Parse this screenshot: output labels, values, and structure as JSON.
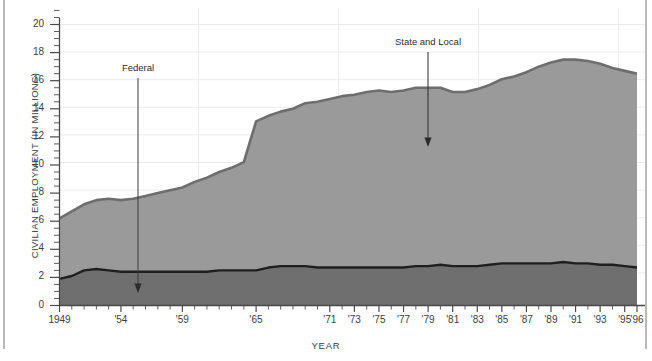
{
  "figure": {
    "title_fragment": "",
    "background": "#ffffff"
  },
  "axes": {
    "ylabel": "CIVILIAN EMPLOYMENT (IN MILLIONS)",
    "xlabel": "YEAR",
    "ytick_labels": [
      "20",
      "18",
      "16",
      "14",
      "12",
      "10",
      "8",
      "6",
      "4",
      "2",
      "0"
    ],
    "xtick_labels": [
      "1949",
      "'54",
      "'59",
      "'65",
      "'71",
      "'73",
      "'75",
      "'77",
      "'79",
      "'81",
      "'83",
      "'85",
      "'87",
      "'89",
      "'91",
      "'93",
      "'95",
      "'96"
    ]
  },
  "annotations": {
    "federal": "Federal",
    "state_local": "State and Local"
  },
  "colors": {
    "state_local_fill": "#9a9a9a",
    "state_local_edge": "#6e6e6e",
    "federal_fill": "#6f6f6f",
    "federal_edge": "#1f1f1f",
    "gridline": "#e8e8e8",
    "axis": "#4a4a4a",
    "text": "#3d3d3d"
  },
  "chart_data": {
    "type": "area",
    "stacked": true,
    "title": "",
    "xlabel": "YEAR",
    "ylabel": "CIVILIAN EMPLOYMENT (IN MILLIONS)",
    "xlim": [
      1949,
      1996
    ],
    "ylim": [
      0,
      20
    ],
    "ytick_values": [
      0,
      2,
      4,
      6,
      8,
      10,
      12,
      14,
      16,
      18,
      20
    ],
    "xtick_values": [
      1949,
      1954,
      1959,
      1965,
      1971,
      1973,
      1975,
      1977,
      1979,
      1981,
      1983,
      1985,
      1987,
      1989,
      1991,
      1993,
      1995,
      1996
    ],
    "grid": "both-faint",
    "legend": "annotated-arrows",
    "x": [
      1949,
      1950,
      1951,
      1952,
      1953,
      1954,
      1955,
      1956,
      1957,
      1958,
      1959,
      1960,
      1961,
      1962,
      1963,
      1964,
      1965,
      1966,
      1967,
      1968,
      1969,
      1970,
      1971,
      1972,
      1973,
      1974,
      1975,
      1976,
      1977,
      1978,
      1979,
      1980,
      1981,
      1982,
      1983,
      1984,
      1985,
      1986,
      1987,
      1988,
      1989,
      1990,
      1991,
      1992,
      1993,
      1994,
      1995,
      1996
    ],
    "series": [
      {
        "name": "Federal",
        "values": [
          1.9,
          2.1,
          2.5,
          2.6,
          2.5,
          2.4,
          2.4,
          2.4,
          2.4,
          2.4,
          2.4,
          2.4,
          2.4,
          2.5,
          2.5,
          2.5,
          2.5,
          2.7,
          2.8,
          2.8,
          2.8,
          2.7,
          2.7,
          2.7,
          2.7,
          2.7,
          2.7,
          2.7,
          2.7,
          2.8,
          2.8,
          2.9,
          2.8,
          2.8,
          2.8,
          2.9,
          3.0,
          3.0,
          3.0,
          3.0,
          3.0,
          3.1,
          3.0,
          3.0,
          2.9,
          2.9,
          2.8,
          2.7
        ]
      },
      {
        "name": "State and Local",
        "values": [
          4.3,
          4.6,
          4.7,
          4.9,
          5.1,
          5.1,
          5.2,
          5.4,
          5.6,
          5.8,
          6.0,
          6.4,
          6.7,
          7.0,
          7.3,
          7.7,
          10.6,
          10.8,
          11.0,
          11.2,
          11.6,
          11.8,
          12.0,
          12.2,
          12.3,
          12.5,
          12.6,
          12.5,
          12.6,
          12.7,
          12.7,
          12.6,
          12.4,
          12.4,
          12.6,
          12.8,
          13.1,
          13.3,
          13.6,
          14.0,
          14.3,
          14.4,
          14.5,
          14.4,
          14.3,
          14.0,
          13.9,
          13.8
        ]
      }
    ],
    "totals": [
      6.2,
      6.7,
      7.2,
      7.5,
      7.6,
      7.5,
      7.6,
      7.8,
      8.0,
      8.2,
      8.4,
      8.8,
      9.1,
      9.5,
      9.8,
      10.2,
      13.1,
      13.5,
      13.8,
      14.0,
      14.4,
      14.5,
      14.7,
      14.9,
      15.0,
      15.2,
      15.3,
      15.2,
      15.3,
      15.5,
      15.5,
      15.5,
      15.2,
      15.2,
      15.4,
      15.7,
      16.1,
      16.3,
      16.6,
      17.0,
      17.3,
      17.5,
      17.5,
      17.4,
      17.2,
      16.9,
      16.7,
      16.5
    ]
  }
}
